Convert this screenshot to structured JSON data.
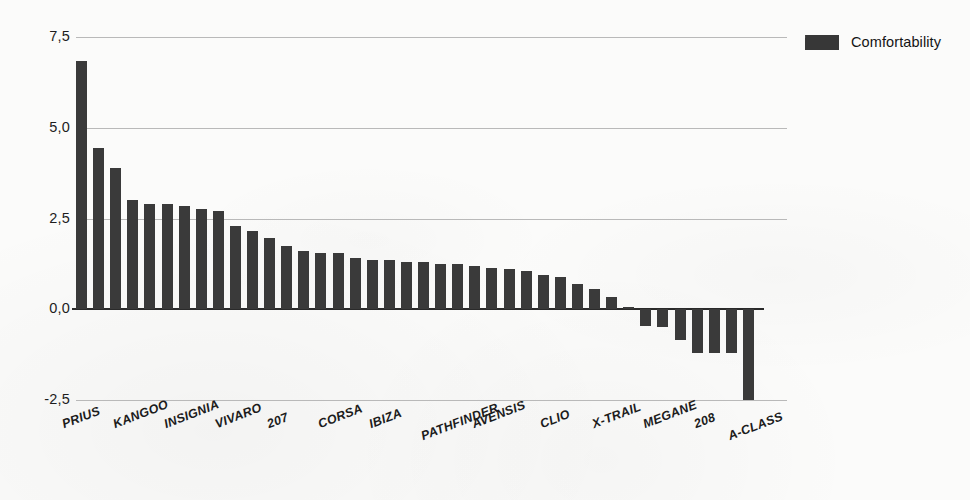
{
  "chart_data": {
    "type": "bar",
    "title": "",
    "xlabel": "",
    "ylabel": "",
    "ylim": [
      -2.5,
      7.5
    ],
    "ytick_labels": [
      "7,5",
      "5,0",
      "2,5",
      "0,0",
      "-2,5"
    ],
    "ytick_values": [
      7.5,
      5.0,
      2.5,
      0.0,
      -2.5
    ],
    "grid": true,
    "legend_position": "top-right",
    "decimal_separator": ",",
    "series": [
      {
        "name": "Comfortability",
        "color": "#3a3a3a",
        "values": [
          6.85,
          4.45,
          3.9,
          3.0,
          2.9,
          2.9,
          2.85,
          2.75,
          2.7,
          2.3,
          2.15,
          1.95,
          1.75,
          1.6,
          1.55,
          1.55,
          1.4,
          1.35,
          1.35,
          1.3,
          1.3,
          1.25,
          1.25,
          1.2,
          1.15,
          1.1,
          1.05,
          0.95,
          0.9,
          0.7,
          0.55,
          0.35,
          0.05,
          -0.45,
          -0.5,
          -0.85,
          -1.2,
          -1.2,
          -1.2,
          -2.5
        ]
      }
    ],
    "categories": [
      "PRIUS",
      "",
      "",
      "KANGOO",
      "",
      "",
      "INSIGNIA",
      "",
      "",
      "VIVARO",
      "",
      "",
      "207",
      "",
      "",
      "CORSA",
      "",
      "",
      "IBIZA",
      "",
      "",
      "PATHFINDER",
      "",
      "",
      "AVENSIS",
      "",
      "",
      "CLIO",
      "",
      "",
      "X-TRAIL",
      "",
      "",
      "MEGANE",
      "",
      "",
      "208",
      "",
      "",
      "A-CLASS"
    ],
    "visible_category_labels": [
      {
        "index": 0,
        "text": "PRIUS"
      },
      {
        "index": 3,
        "text": "KANGOO"
      },
      {
        "index": 6,
        "text": "INSIGNIA"
      },
      {
        "index": 9,
        "text": "VIVARO"
      },
      {
        "index": 12,
        "text": "207"
      },
      {
        "index": 15,
        "text": "CORSA"
      },
      {
        "index": 18,
        "text": "IBIZA"
      },
      {
        "index": 21,
        "text": "PATHFINDER"
      },
      {
        "index": 24,
        "text": "AVENSIS"
      },
      {
        "index": 28,
        "text": "CLIO"
      },
      {
        "index": 31,
        "text": "X-TRAIL"
      },
      {
        "index": 34,
        "text": "MEGANE"
      },
      {
        "index": 37,
        "text": "208"
      },
      {
        "index": 39,
        "text": "A-CLASS"
      }
    ]
  },
  "legend": {
    "entries": [
      {
        "label": "Comfortability",
        "color": "#3a3a3a"
      }
    ]
  },
  "axis": {
    "y_tick_labels": [
      "7,5",
      "5,0",
      "2,5",
      "0,0",
      "-2,5"
    ]
  }
}
